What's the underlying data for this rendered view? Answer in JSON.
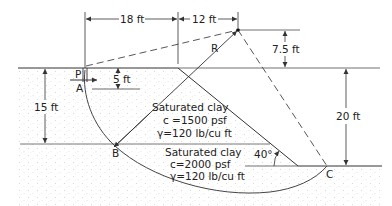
{
  "figure": {
    "type": "slope-stability-section",
    "dimensions": {
      "horizontal_left": "18 ft",
      "horizontal_right": "12 ft",
      "center_height_above_crest": "7.5 ft",
      "slope_height": "20 ft",
      "upper_layer_thickness": "15 ft",
      "tension_crack_depth": "5 ft"
    },
    "points": {
      "P": "P",
      "A": "A",
      "B": "B",
      "C": "C",
      "radius": "R"
    },
    "slope_angle": "40°",
    "layers": [
      {
        "name": "Saturated clay",
        "cohesion": "c =1500 psf",
        "unit_weight": "γ=120 lb/cu ft"
      },
      {
        "name": "Saturated clay",
        "cohesion": "c=2000 psf",
        "unit_weight": "γ=120 lb/cu ft"
      }
    ],
    "colors": {
      "line": "#333333",
      "soil_dots": "#9a9a9a"
    }
  }
}
